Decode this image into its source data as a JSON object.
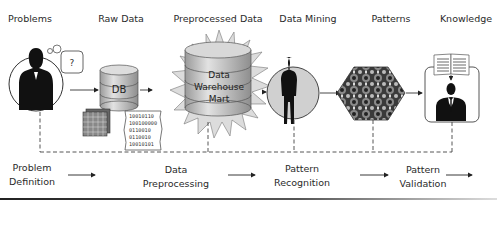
{
  "stages": [
    {
      "label": "Problems",
      "x": 30
    },
    {
      "label": "Raw Data",
      "x": 123
    },
    {
      "label": "Preprocessed Data",
      "x": 222
    },
    {
      "label": "Data Mining",
      "x": 316
    },
    {
      "label": "Patterns",
      "x": 372
    },
    {
      "label": "Knowledge",
      "x": 460
    }
  ],
  "steps": [
    {
      "line1": "Problem",
      "line2": "Definition"
    },
    {
      "line1": "Data",
      "line2": "Preprocessing"
    },
    {
      "line1": "Pattern",
      "line2": "Recognition"
    },
    {
      "line1": "Pattern",
      "line2": "Validation"
    }
  ],
  "icons": {
    "thought_bubble": "?",
    "db_label": "DB",
    "warehouse_lines": [
      "Data",
      "Warehouse",
      "Mart"
    ],
    "binary_lines": [
      "10010110",
      "100100000",
      "0110010",
      "0110010",
      "10010101"
    ]
  },
  "colors": {
    "line": "#333333",
    "cylinder": "#c8c8c8",
    "circle_fill": "#d0d0d0",
    "silhouette": "#111111"
  }
}
